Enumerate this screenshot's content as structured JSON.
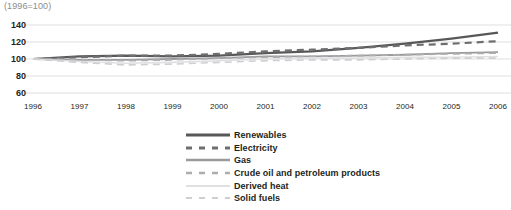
{
  "chart_data": {
    "type": "line",
    "title": "(1996=100)",
    "xlabel": "",
    "ylabel": "",
    "grid": true,
    "legend_position": "bottom-center",
    "x": [
      1996,
      1997,
      1998,
      1999,
      2000,
      2001,
      2002,
      2003,
      2004,
      2005,
      2006
    ],
    "xticklabels": [
      "1996",
      "1997",
      "1998",
      "1999",
      "2000",
      "2001",
      "2002",
      "2003",
      "2004",
      "2005",
      "2006"
    ],
    "yticklabels": [
      "60",
      "80",
      "100",
      "120",
      "140"
    ],
    "yticks": [
      60,
      80,
      100,
      120,
      140
    ],
    "ylim": [
      60,
      145
    ],
    "xlim": [
      1996,
      2006
    ],
    "series": [
      {
        "name": "Renewables",
        "color": "#58585a",
        "style": "solid",
        "width": 2.2,
        "values": [
          100,
          103,
          104,
          103,
          104,
          107,
          109,
          113,
          118,
          124,
          131
        ]
      },
      {
        "name": "Electricity",
        "color": "#6e6e70",
        "style": "dashed",
        "width": 2.2,
        "values": [
          100,
          102,
          104,
          104,
          106,
          109,
          111,
          113,
          116,
          118,
          121
        ]
      },
      {
        "name": "Gas",
        "color": "#9a9a9c",
        "style": "solid",
        "width": 1.8,
        "values": [
          100,
          99,
          99,
          100,
          101,
          103,
          103,
          104,
          105,
          107,
          108
        ]
      },
      {
        "name": "Crude oil and petroleum products",
        "color": "#adadaf",
        "style": "dashed",
        "width": 1.8,
        "values": [
          100,
          99,
          98,
          99,
          101,
          102,
          103,
          104,
          105,
          106,
          107
        ]
      },
      {
        "name": "Derived heat",
        "color": "#e0e0e2",
        "style": "solid",
        "width": 1.6,
        "values": [
          100,
          97,
          95,
          96,
          98,
          100,
          101,
          101,
          102,
          102,
          103
        ]
      },
      {
        "name": "Solid fuels",
        "color": "#cfcfd1",
        "style": "dashed",
        "width": 1.6,
        "values": [
          100,
          96,
          93,
          94,
          96,
          98,
          99,
          99,
          100,
          101,
          101
        ]
      }
    ]
  },
  "axis": {
    "gridline_color": "#d7d7d9",
    "tick_text_color": "#231f20"
  }
}
